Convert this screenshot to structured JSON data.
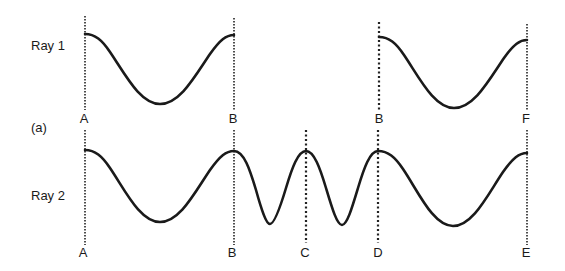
{
  "figure": {
    "panel_label": "(a)",
    "colors": {
      "ink": "#1a1a1a",
      "background": "#ffffff"
    }
  },
  "ray1": {
    "label": "Ray 1",
    "segments": [
      {
        "from": "A",
        "to": "B",
        "cycles": 1
      },
      {
        "from": "B",
        "to": "F",
        "cycles": 1
      }
    ],
    "markers": [
      {
        "label": "A",
        "style": "dashed"
      },
      {
        "label": "B",
        "style": "dashed"
      },
      {
        "label": "B",
        "style": "dotted"
      },
      {
        "label": "F",
        "style": "dashed"
      }
    ]
  },
  "ray2": {
    "label": "Ray 2",
    "segments": [
      {
        "from": "A",
        "to": "B",
        "cycles": 1
      },
      {
        "from": "B",
        "to": "C",
        "cycles": 1
      },
      {
        "from": "C",
        "to": "D",
        "cycles": 1
      },
      {
        "from": "D",
        "to": "E",
        "cycles": 1
      }
    ],
    "markers": [
      {
        "label": "A",
        "style": "dashed"
      },
      {
        "label": "B",
        "style": "dashed"
      },
      {
        "label": "C",
        "style": "dotted"
      },
      {
        "label": "D",
        "style": "dotted"
      },
      {
        "label": "E",
        "style": "dashed"
      }
    ]
  }
}
